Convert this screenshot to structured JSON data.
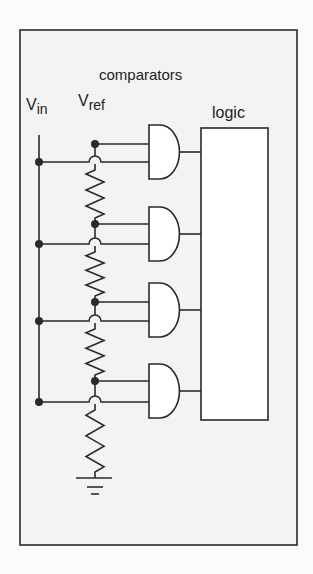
{
  "labels": {
    "comparators": "comparators",
    "vin_main": "V",
    "vin_sub": "in",
    "vref_main": "V",
    "vref_sub": "ref",
    "logic": "logic"
  },
  "colors": {
    "frame_fill": "#f3f3f3",
    "stroke": "#2a2a2a",
    "logic_fill": "#ffffff",
    "gate_fill": "#ffffff"
  },
  "frame": {
    "x": 20,
    "y": 30,
    "w": 277,
    "h": 515
  },
  "vin_line": {
    "x": 39,
    "y1": 135,
    "y2": 402
  },
  "vref_x": 95,
  "vref_top": 144,
  "logic_box": {
    "x": 201,
    "y": 128,
    "w": 67,
    "h": 292
  },
  "gates": [
    {
      "top": 125,
      "bottom": 179,
      "vref_y": 144,
      "vin_y": 162
    },
    {
      "top": 207,
      "bottom": 261,
      "vref_y": 224,
      "vin_y": 244
    },
    {
      "top": 283,
      "bottom": 337,
      "vref_y": 302,
      "vin_y": 321
    },
    {
      "top": 364,
      "bottom": 418,
      "vref_y": 381,
      "vin_y": 402
    }
  ],
  "gate_x": {
    "left": 149,
    "flat": 160
  },
  "ground": {
    "y": 478,
    "x1": 76,
    "x2": 112
  }
}
